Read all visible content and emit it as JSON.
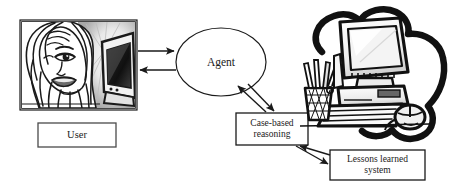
{
  "diagram": {
    "type": "flow-diagram",
    "background_color": "#ffffff",
    "line_color": "#1a1a1a",
    "nodes": [
      {
        "id": "user-photo",
        "shape": "framed-image",
        "kind": "illustration",
        "description": "pop-art comic panel of a woman looking at a computer monitor",
        "label": ""
      },
      {
        "id": "user-box",
        "shape": "rectangle",
        "label": "User"
      },
      {
        "id": "agent-ellipse",
        "shape": "ellipse",
        "label": "Agent"
      },
      {
        "id": "cbr-box",
        "shape": "rectangle",
        "label": "Case-based\nreasoning"
      },
      {
        "id": "lls-box",
        "shape": "rectangle",
        "label": "Lessons learned\nsystem"
      },
      {
        "id": "computer-illustration",
        "shape": "sketch",
        "kind": "illustration",
        "description": "hand-drawn desktop computer with monitor, keyboard, mouse and pencil cup inside a dark cloud outline",
        "label": ""
      }
    ],
    "edges": [
      {
        "id": "user-to-agent",
        "from": "user-photo",
        "to": "agent-ellipse",
        "direction": "forward",
        "style": "straight"
      },
      {
        "id": "agent-to-user",
        "from": "agent-ellipse",
        "to": "user-photo",
        "direction": "forward",
        "style": "straight"
      },
      {
        "id": "agent-to-cbr",
        "from": "agent-ellipse",
        "to": "cbr-box",
        "direction": "forward",
        "style": "straight"
      },
      {
        "id": "cbr-to-agent",
        "from": "cbr-box",
        "to": "agent-ellipse",
        "direction": "forward",
        "style": "straight"
      },
      {
        "id": "cbr-to-lls",
        "from": "cbr-box",
        "to": "lls-box",
        "direction": "forward",
        "style": "straight"
      },
      {
        "id": "lls-to-cbr",
        "from": "lls-box",
        "to": "cbr-box",
        "direction": "forward",
        "style": "straight"
      }
    ]
  }
}
